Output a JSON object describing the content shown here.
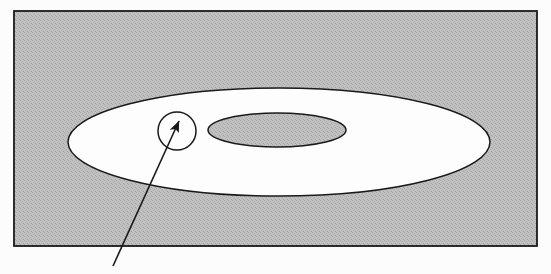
{
  "figure": {
    "width": 551,
    "height": 274,
    "background_color": "#fcfcfc",
    "stroke_color": "#1a1a1a",
    "shading_color": "#b9b9b9",
    "white_fill_color": "#fdfdfd"
  },
  "frame": {
    "name": "outer rectangle frame",
    "x": 14,
    "y": 11,
    "width": 523,
    "height": 235,
    "fill": "#b9b9b9",
    "stroke": "#1a1a1a",
    "stroke_width": 1.6
  },
  "shapes": {
    "outer_ellipse": {
      "name": "large white ellipse",
      "cx": 279,
      "cy": 142,
      "rx": 211,
      "ry": 54,
      "fill": "#fdfdfd",
      "stroke": "#1a1a1a",
      "stroke_width": 1.4
    },
    "inner_ellipse": {
      "name": "small shaded inner ellipse",
      "cx": 277,
      "cy": 130,
      "rx": 69,
      "ry": 17,
      "fill": "#b9b9b9",
      "stroke": "#1a1a1a",
      "stroke_width": 1.4
    },
    "callout_circle": {
      "name": "callout detail circle",
      "cx": 177,
      "cy": 131,
      "r": 19,
      "fill": "#fdfdfd",
      "stroke": "#1a1a1a",
      "stroke_width": 1.4
    }
  },
  "leader": {
    "name": "leader line with arrowhead",
    "x1": 113,
    "y1": 266,
    "x2": 179,
    "y2": 121,
    "stroke": "#1a1a1a",
    "stroke_width": 1.6,
    "arrowhead": "filled-triangle"
  },
  "labels": {
    "caption": ""
  }
}
